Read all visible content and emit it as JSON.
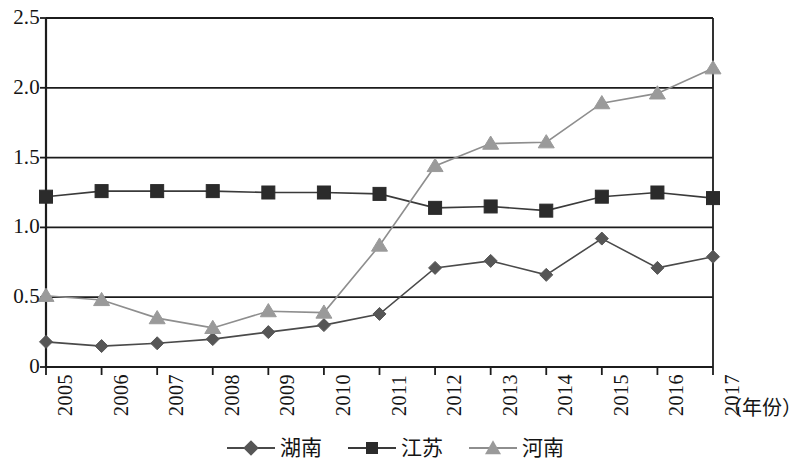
{
  "chart_data": {
    "type": "line",
    "title": "",
    "xlabel": "（年份）",
    "ylabel": "",
    "categories": [
      "2005",
      "2006",
      "2007",
      "2008",
      "2009",
      "2010",
      "2011",
      "2012",
      "2013",
      "2014",
      "2015",
      "2016",
      "2017"
    ],
    "ylim": [
      0,
      2.5
    ],
    "xlim": [
      2005,
      2017
    ],
    "y_ticks": [
      "0",
      "0.5",
      "1.0",
      "1.5",
      "2.0",
      "2.5"
    ],
    "y_tick_values": [
      0,
      0.5,
      1.0,
      1.5,
      2.0,
      2.5
    ],
    "grid": "horizontal",
    "legend_position": "bottom-center",
    "series": [
      {
        "name": "湖南",
        "marker": "diamond",
        "color": "#565656",
        "line_color": "#4a4a4a",
        "values": [
          0.18,
          0.15,
          0.17,
          0.2,
          0.25,
          0.3,
          0.38,
          0.71,
          0.76,
          0.66,
          0.92,
          0.71,
          0.79
        ]
      },
      {
        "name": "江苏",
        "marker": "square",
        "color": "#2b2b2b",
        "line_color": "#3a3a3a",
        "values": [
          1.22,
          1.26,
          1.26,
          1.26,
          1.25,
          1.25,
          1.24,
          1.14,
          1.15,
          1.12,
          1.22,
          1.25,
          1.21
        ]
      },
      {
        "name": "河南",
        "marker": "triangle",
        "color": "#9a9a9a",
        "line_color": "#8e8e8e",
        "values": [
          0.51,
          0.48,
          0.35,
          0.28,
          0.4,
          0.39,
          0.87,
          1.44,
          1.6,
          1.61,
          1.89,
          1.96,
          2.14
        ]
      }
    ]
  },
  "plot": {
    "left": 46,
    "right": 713,
    "top": 18,
    "bottom": 367,
    "axis_color": "#1c1c1c",
    "grid_color": "#1c1c1c",
    "background": "#ffffff"
  }
}
